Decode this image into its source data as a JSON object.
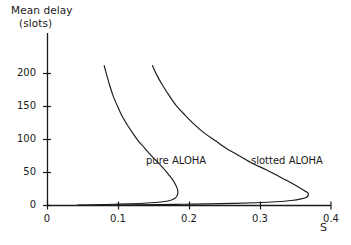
{
  "figure": {
    "background_color": "#ffffff",
    "line_color": "#1a1a1a",
    "text_color": "#1a1a1a"
  },
  "chart_data": {
    "type": "line",
    "title": "",
    "subtitle": "",
    "xlabel": "S",
    "ylabel": "Mean delay",
    "ylabel_line1": "Mean delay",
    "ylabel_line2": "(slots)",
    "ylabel_units": "slots",
    "xlim": [
      0,
      0.4
    ],
    "ylim": [
      0,
      215
    ],
    "grid": false,
    "legend_position": "inline-annotation",
    "xticks": [
      0,
      0.1,
      0.2,
      0.3,
      0.4
    ],
    "xtick_labels": [
      "0",
      "0.1",
      "0.2",
      "0.3",
      "0.4"
    ],
    "yticks": [
      0,
      50,
      100,
      150,
      200
    ],
    "ytick_labels": [
      "0",
      "50",
      "100",
      "150",
      "200"
    ],
    "annotations": [
      {
        "text": "pure ALOHA",
        "x": 0.155,
        "y": 47
      },
      {
        "text": "slotted ALOHA",
        "x": 0.3,
        "y": 47
      }
    ],
    "series": [
      {
        "name": "pure ALOHA",
        "label": "pure ALOHA",
        "color": "#1a1a1a",
        "note": "backward-bending throughput-delay curve; knee (maximum throughput) near S = 0.184",
        "knee_x": 0.184,
        "knee_y": 16,
        "points": [
          [
            0.08,
            212
          ],
          [
            0.084,
            196
          ],
          [
            0.088,
            181
          ],
          [
            0.093,
            165
          ],
          [
            0.099,
            150
          ],
          [
            0.105,
            136
          ],
          [
            0.112,
            123
          ],
          [
            0.12,
            110
          ],
          [
            0.128,
            98
          ],
          [
            0.137,
            87
          ],
          [
            0.146,
            76
          ],
          [
            0.155,
            66
          ],
          [
            0.163,
            57
          ],
          [
            0.17,
            48
          ],
          [
            0.176,
            40
          ],
          [
            0.18,
            33
          ],
          [
            0.183,
            26
          ],
          [
            0.184,
            20
          ],
          [
            0.183,
            15
          ],
          [
            0.18,
            11
          ],
          [
            0.174,
            8
          ],
          [
            0.165,
            6
          ],
          [
            0.152,
            4.5
          ],
          [
            0.136,
            3.4
          ],
          [
            0.118,
            2.6
          ],
          [
            0.1,
            2.0
          ],
          [
            0.082,
            1.5
          ],
          [
            0.066,
            1.1
          ],
          [
            0.054,
            0.8
          ],
          [
            0.046,
            0.5
          ],
          [
            0.042,
            0.3
          ]
        ]
      },
      {
        "name": "slotted ALOHA",
        "label": "slotted ALOHA",
        "color": "#1a1a1a",
        "note": "backward-bending throughput-delay curve; knee (maximum throughput) near S = 0.368",
        "knee_x": 0.368,
        "knee_y": 17,
        "points": [
          [
            0.148,
            212
          ],
          [
            0.155,
            196
          ],
          [
            0.163,
            181
          ],
          [
            0.172,
            166
          ],
          [
            0.182,
            151
          ],
          [
            0.194,
            137
          ],
          [
            0.207,
            123
          ],
          [
            0.221,
            110
          ],
          [
            0.237,
            98
          ],
          [
            0.253,
            86
          ],
          [
            0.271,
            75
          ],
          [
            0.289,
            64
          ],
          [
            0.307,
            55
          ],
          [
            0.325,
            45
          ],
          [
            0.341,
            36
          ],
          [
            0.354,
            28
          ],
          [
            0.363,
            22
          ],
          [
            0.368,
            18
          ],
          [
            0.366,
            13
          ],
          [
            0.358,
            10
          ],
          [
            0.344,
            7.5
          ],
          [
            0.322,
            5.6
          ],
          [
            0.294,
            4.2
          ],
          [
            0.262,
            3.2
          ],
          [
            0.228,
            2.5
          ],
          [
            0.192,
            1.9
          ],
          [
            0.156,
            1.4
          ],
          [
            0.122,
            1.0
          ],
          [
            0.092,
            0.7
          ],
          [
            0.066,
            0.45
          ],
          [
            0.048,
            0.25
          ],
          [
            0.042,
            0.15
          ]
        ]
      }
    ]
  },
  "axes": {
    "x_axis_name": "horizontal-axis",
    "y_axis_name": "vertical-axis"
  }
}
